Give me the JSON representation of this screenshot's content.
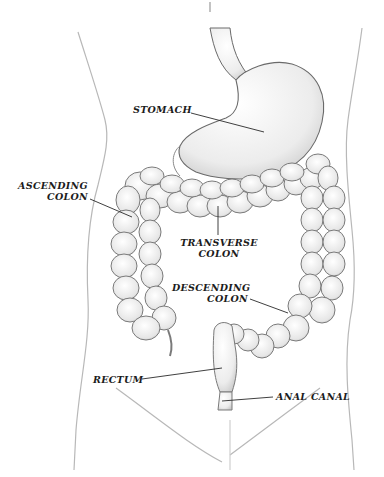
{
  "diagram": {
    "type": "anatomical-illustration",
    "colors": {
      "background": "#ffffff",
      "outline": "#6a6a6a",
      "organ_fill": "#efefef",
      "organ_shade": "#cfcfcf",
      "label_text": "#1c1c1c",
      "leader_line": "#2a2a2a"
    },
    "labels": [
      {
        "id": "stomach",
        "lines": [
          "STOMACH"
        ]
      },
      {
        "id": "ascending-colon",
        "lines": [
          "ASCENDING",
          "COLON"
        ]
      },
      {
        "id": "transverse-colon",
        "lines": [
          "TRANSVERSE",
          "COLON"
        ]
      },
      {
        "id": "descending-colon",
        "lines": [
          "DESCENDING",
          "COLON"
        ]
      },
      {
        "id": "rectum",
        "lines": [
          "RECTUM"
        ]
      },
      {
        "id": "anal-canal",
        "lines": [
          "ANAL CANAL"
        ]
      }
    ]
  }
}
